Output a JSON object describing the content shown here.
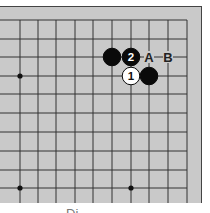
{
  "diagram": {
    "type": "go-board-fragment",
    "board_color": "#c9c9c9",
    "line_color": "#333333",
    "grid": {
      "x_lines": [
        20,
        38,
        56,
        75,
        93,
        112,
        131,
        149,
        168,
        187
      ],
      "y_lines": [
        20,
        39,
        57,
        76,
        94,
        113,
        132,
        151,
        170,
        188
      ]
    },
    "star_points": [
      {
        "col": 0,
        "row": 3
      },
      {
        "col": 0,
        "row": 9
      },
      {
        "col": 6,
        "row": 9
      }
    ],
    "stones": [
      {
        "col": 5,
        "row": 2,
        "color": "black",
        "label": ""
      },
      {
        "col": 6,
        "row": 2,
        "color": "black",
        "label": "2"
      },
      {
        "col": 6,
        "row": 3,
        "color": "white",
        "label": "1"
      },
      {
        "col": 7,
        "row": 3,
        "color": "black",
        "label": ""
      }
    ],
    "markers": [
      {
        "col": 7,
        "row": 2,
        "label": "A"
      },
      {
        "col": 8,
        "row": 2,
        "label": "B"
      }
    ],
    "caption": "Di"
  }
}
